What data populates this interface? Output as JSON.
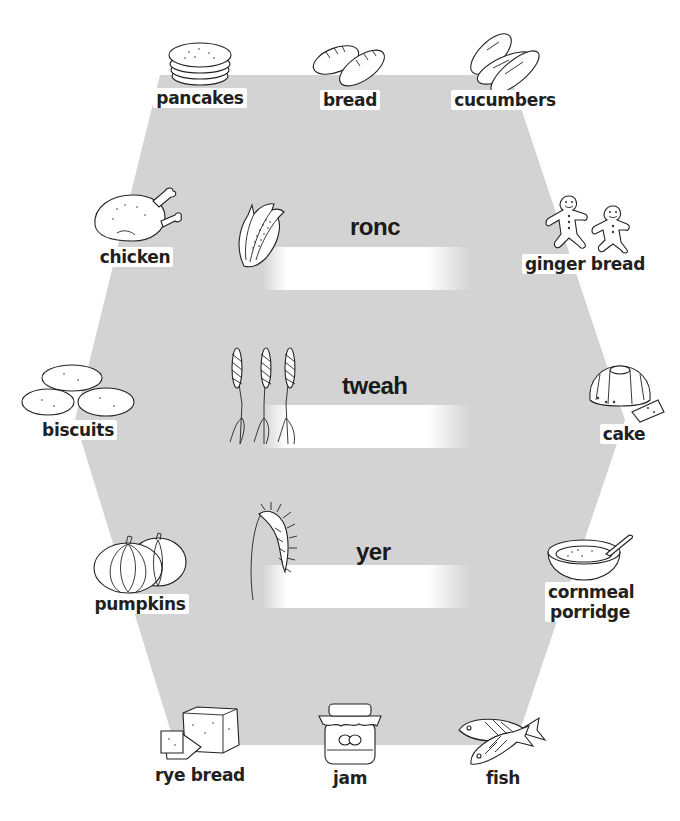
{
  "worksheet": {
    "background_color": "#d3d3d3",
    "hexagon_points": "160,75 510,75 625,420 515,745 175,745 75,420",
    "scrambled_words": [
      {
        "scrambled": "ronc",
        "image": "corn-cob-icon"
      },
      {
        "scrambled": "tweah",
        "image": "wheat-stalks-icon"
      },
      {
        "scrambled": "yer",
        "image": "rye-ear-icon"
      }
    ],
    "foods": {
      "top": [
        {
          "label": "pancakes",
          "icon": "pancakes-icon"
        },
        {
          "label": "bread",
          "icon": "bread-loaves-icon"
        },
        {
          "label": "cucumbers",
          "icon": "cucumbers-icon"
        }
      ],
      "left": [
        {
          "label": "chicken",
          "icon": "roast-chicken-icon"
        },
        {
          "label": "biscuits",
          "icon": "biscuits-icon"
        },
        {
          "label": "pumpkins",
          "icon": "pumpkins-icon"
        }
      ],
      "right": [
        {
          "label": "ginger bread",
          "icon": "gingerbread-men-icon"
        },
        {
          "label": "cake",
          "icon": "bundt-cake-icon"
        },
        {
          "label": "cornmeal porridge",
          "icon": "porridge-bowl-icon"
        }
      ],
      "bottom": [
        {
          "label": "rye bread",
          "icon": "rye-bread-loaf-icon"
        },
        {
          "label": "jam",
          "icon": "jam-jar-icon"
        },
        {
          "label": "fish",
          "icon": "fish-icon"
        }
      ]
    }
  }
}
